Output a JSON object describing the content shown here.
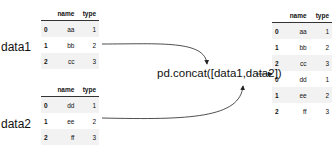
{
  "labels": {
    "data1": "data1",
    "data2": "data2"
  },
  "expression": "pd.concat([data1,data2])",
  "columns": [
    "",
    "name",
    "type"
  ],
  "data1": [
    [
      "0",
      "aa",
      "1"
    ],
    [
      "1",
      "bb",
      "2"
    ],
    [
      "2",
      "cc",
      "3"
    ]
  ],
  "data2": [
    [
      "0",
      "dd",
      "1"
    ],
    [
      "1",
      "ee",
      "2"
    ],
    [
      "2",
      "ff",
      "3"
    ]
  ],
  "result": [
    [
      "0",
      "aa",
      "1"
    ],
    [
      "1",
      "bb",
      "2"
    ],
    [
      "2",
      "cc",
      "3"
    ],
    [
      "0",
      "dd",
      "1"
    ],
    [
      "1",
      "ee",
      "2"
    ],
    [
      "2",
      "ff",
      "3"
    ]
  ]
}
